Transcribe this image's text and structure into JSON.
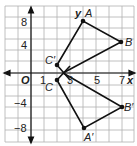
{
  "diagram": {
    "type": "coordinate-plane-reflection",
    "axes": {
      "x_label": "x",
      "y_label": "y",
      "origin_label": "O",
      "x_ticks": [
        "1",
        "3",
        "5",
        "7"
      ],
      "y_ticks": [
        "8",
        "4",
        "−4",
        "−8"
      ]
    },
    "points": {
      "A": "A",
      "B": "B",
      "C": "C",
      "A_prime": "A′",
      "B_prime": "B′",
      "C_prime": "C′"
    },
    "colors": {
      "grid": "#b0b0b0",
      "lines": "#111111",
      "background": "#ffffff"
    }
  }
}
